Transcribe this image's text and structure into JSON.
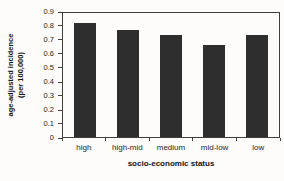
{
  "chart_data": {
    "type": "bar",
    "categories": [
      "high",
      "high-mid",
      "medium",
      "mid-low",
      "low"
    ],
    "values": [
      0.83,
      0.78,
      0.74,
      0.67,
      0.74
    ],
    "title": "",
    "xlabel": "socio-economic status",
    "ylabel_line1": "age-adjusted incidence",
    "ylabel_line2": "(per 100,000)",
    "ylim": [
      0,
      0.9
    ],
    "y_ticks": [
      "0.9",
      "0.8",
      "0.7",
      "0.6",
      "0.5",
      "0.4",
      "0.3",
      "0.2",
      "0.1",
      "0"
    ],
    "grid": false,
    "legend": false,
    "bar_color": "#2e2e2e",
    "frame_color": "#3f3f3f",
    "background": "#fdfcfa"
  }
}
